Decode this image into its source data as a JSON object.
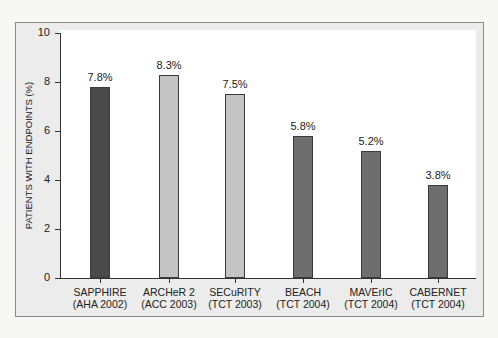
{
  "chart_data": {
    "type": "bar",
    "title": "",
    "xlabel": "",
    "ylabel": "PATIENTS WITH ENDPOINTS (%)",
    "ylim": [
      0,
      10
    ],
    "yticks": [
      "0",
      "2",
      "4",
      "6",
      "8",
      "10"
    ],
    "grid": false,
    "categories": [
      "SAPPHIRE (AHA 2002)",
      "ARCHeR 2 (ACC 2003)",
      "SECuRITY (TCT 2003)",
      "BEACH (TCT 2004)",
      "MAVErIC (TCT 2004)",
      "CABERNET (TCT 2004)"
    ],
    "category_lines": [
      [
        "SAPPHIRE",
        "(AHA 2002)"
      ],
      [
        "ARCHeR 2",
        "(ACC 2003)"
      ],
      [
        "SECuRITY",
        "(TCT 2003)"
      ],
      [
        "BEACH",
        "(TCT 2004)"
      ],
      [
        "MAVErIC",
        "(TCT 2004)"
      ],
      [
        "CABERNET",
        "(TCT 2004)"
      ]
    ],
    "values": [
      7.8,
      8.3,
      7.5,
      5.8,
      5.2,
      3.8
    ],
    "value_labels": [
      "7.8%",
      "8.3%",
      "7.5%",
      "5.8%",
      "5.2%",
      "3.8%"
    ],
    "bar_colors": [
      "#4a4a4a",
      "#c4c4c4",
      "#c4c4c4",
      "#6e6e6e",
      "#6e6e6e",
      "#6e6e6e"
    ]
  }
}
